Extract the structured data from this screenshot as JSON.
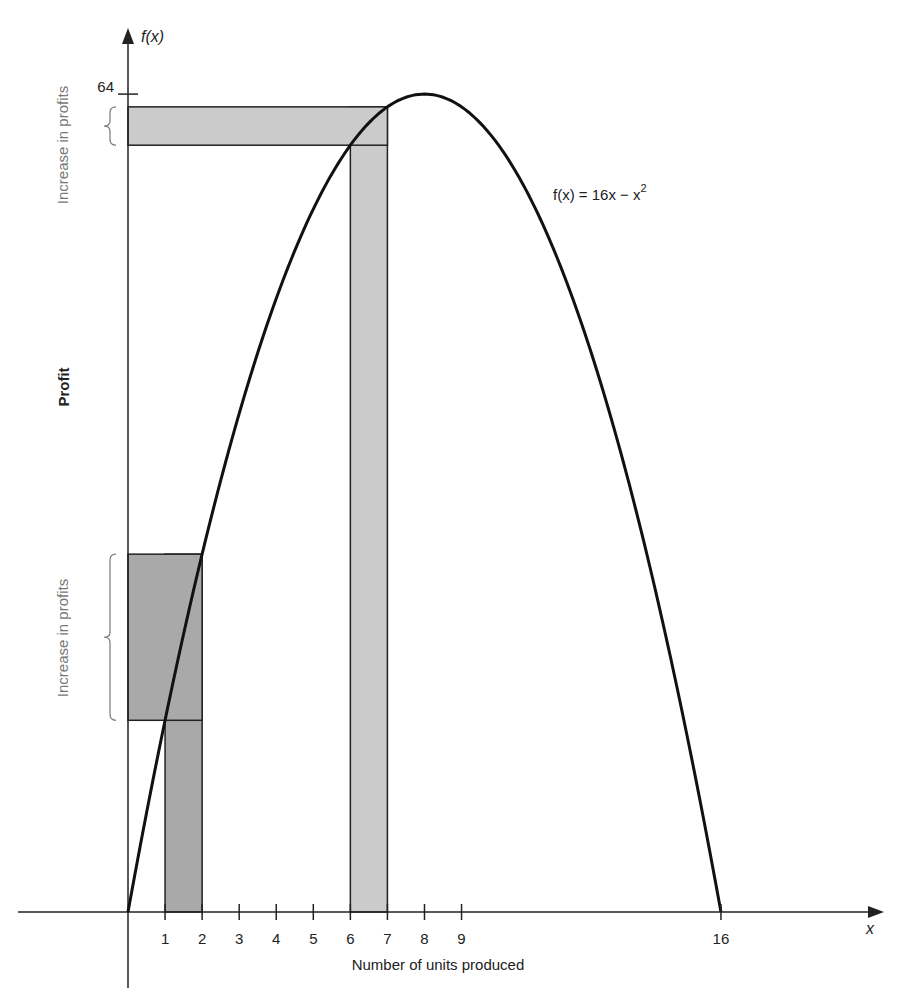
{
  "chart_data": {
    "type": "line",
    "title": "",
    "function_label": "f(x) = 16x − x²",
    "function_label_parts": {
      "lhs": "f(x) = 16x − x",
      "exp": "2"
    },
    "xlabel": "Number of units produced",
    "ylabel": "Profit",
    "x_axis_name": "x",
    "y_axis_name": "f(x)",
    "xlim": [
      -3,
      20
    ],
    "ylim": [
      -6,
      70
    ],
    "x_ticks": [
      1,
      2,
      3,
      4,
      5,
      6,
      7,
      8,
      9,
      16
    ],
    "x_tick_labels": [
      "1",
      "2",
      "3",
      "4",
      "5",
      "6",
      "7",
      "8",
      "9",
      "16"
    ],
    "y_ticks": [
      64
    ],
    "y_tick_labels": [
      "64"
    ],
    "grid": false,
    "series": [
      {
        "name": "f(x) = 16x - x^2",
        "coefficients": {
          "a": -1,
          "b": 16,
          "c": 0
        },
        "x_range": [
          0,
          16
        ]
      }
    ],
    "sample_points": [
      {
        "x": 0,
        "y": 0
      },
      {
        "x": 1,
        "y": 15
      },
      {
        "x": 2,
        "y": 28
      },
      {
        "x": 6,
        "y": 60
      },
      {
        "x": 7,
        "y": 63
      },
      {
        "x": 8,
        "y": 64
      },
      {
        "x": 16,
        "y": 0
      }
    ],
    "highlights": [
      {
        "name": "low-output",
        "x_from": 1,
        "x_to": 2,
        "y_from": 15,
        "y_to": 28,
        "color": "#a9a9a9",
        "annotation": "Increase in profits"
      },
      {
        "name": "high-output",
        "x_from": 6,
        "x_to": 7,
        "y_from": 60,
        "y_to": 63,
        "color": "#cbcbcb",
        "annotation": "Increase in profits"
      }
    ]
  }
}
